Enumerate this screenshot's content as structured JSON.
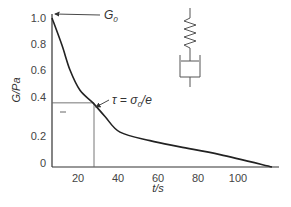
{
  "chart_data": {
    "type": "line",
    "title": "",
    "xlabel": "t/s",
    "ylabel": "G/Pa",
    "xlim": [
      0,
      120
    ],
    "ylim": [
      0,
      1.0
    ],
    "grid": false,
    "legend": "none",
    "x_ticks": [
      {
        "value": 20,
        "label": "20"
      },
      {
        "value": 40,
        "label": "40"
      },
      {
        "value": 60,
        "label": "60"
      },
      {
        "value": 80,
        "label": "80"
      },
      {
        "value": 100,
        "label": "100"
      }
    ],
    "y_ticks": [
      {
        "value": 0,
        "label": "0"
      },
      {
        "value": 0.2,
        "label": "0.2"
      },
      {
        "value": 0.4,
        "label": "0.4"
      },
      {
        "value": 0.6,
        "label": "0.6"
      },
      {
        "value": 0.8,
        "label": "0.8"
      },
      {
        "value": 1.0,
        "label": "1.0"
      }
    ],
    "series": [
      {
        "name": "relaxation modulus",
        "color": "#222222",
        "points": [
          [
            7,
            1.0
          ],
          [
            12,
            0.79
          ],
          [
            16,
            0.6
          ],
          [
            21,
            0.45
          ],
          [
            27.5,
            0.37
          ],
          [
            33.5,
            0.3
          ],
          [
            41,
            0.22
          ],
          [
            56,
            0.17
          ],
          [
            71,
            0.13
          ],
          [
            91,
            0.08
          ],
          [
            117,
            0.0
          ]
        ]
      }
    ],
    "reference_point": {
      "t": 28,
      "G": 0.37,
      "color": "#666666"
    },
    "annotations": [
      {
        "name": "g0",
        "text_main": "G",
        "text_sub": "0",
        "points_to": [
          7,
          1.0
        ]
      },
      {
        "name": "tau",
        "text_main": "τ = σ",
        "text_sub": "0",
        "text_tail": "/e",
        "points_to": [
          28,
          0.37
        ]
      }
    ],
    "inset": {
      "name": "maxwell-model",
      "description": "spring and dashpot in series"
    }
  }
}
